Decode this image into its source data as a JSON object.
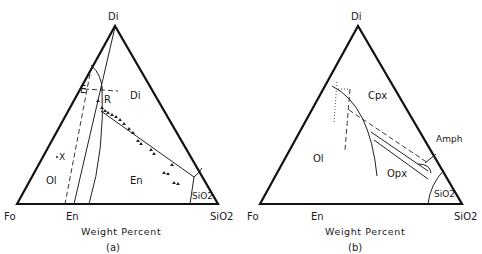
{
  "figure": {
    "panels": [
      {
        "id": "a",
        "caption": "(a)",
        "axis_label": "Weight Percent",
        "vertices": {
          "top": "Di",
          "left": "Fo",
          "right": "SiO2"
        },
        "base_labels": [
          "Fo",
          "En",
          "SiO2"
        ],
        "field_labels": {
          "di": "Di",
          "ol": "Ol",
          "en": "En",
          "sio2": "SiO2"
        },
        "point_labels": {
          "e": "E",
          "r": "R",
          "x": "X"
        }
      },
      {
        "id": "b",
        "caption": "(b)",
        "axis_label": "Weight Percent",
        "vertices": {
          "top": "Di",
          "left": "Fo",
          "right": "SiO2"
        },
        "base_labels": [
          "Fo",
          "En",
          "SiO2"
        ],
        "field_labels": {
          "cpx": "Cpx",
          "ol": "Ol",
          "opx": "Opx",
          "amph": "Amph",
          "sio2": "SiO2"
        }
      }
    ]
  }
}
